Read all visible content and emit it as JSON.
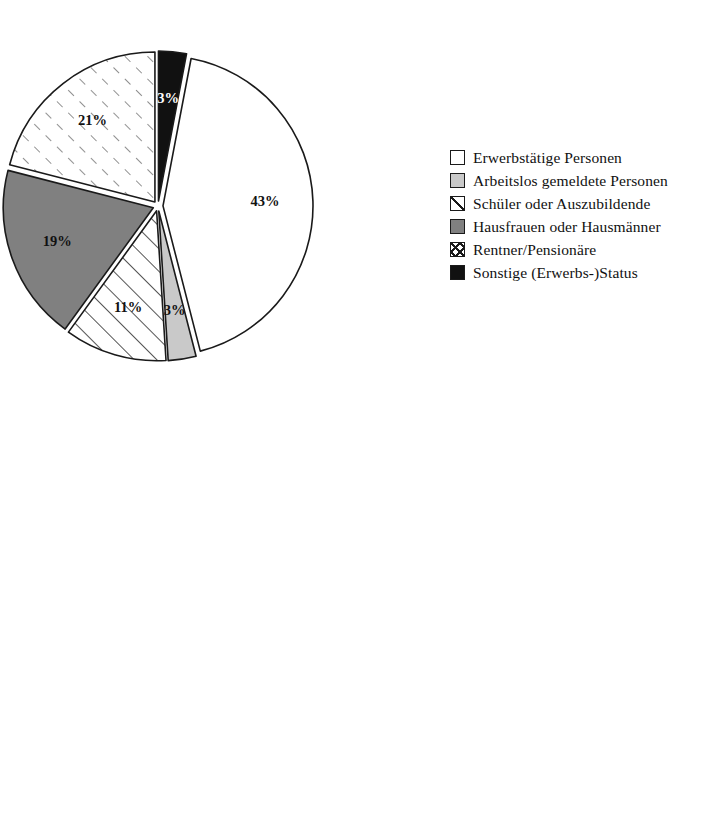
{
  "page": {
    "background": "#ffffff",
    "ink": "#111111"
  },
  "palette": {
    "black": "#111111",
    "white": "#ffffff",
    "light_gray": "#c9c9c9",
    "dark_gray": "#808080",
    "outline": "#1a1a1a"
  },
  "chart_data": [
    {
      "type": "pie",
      "id": "erwerbsstatus",
      "title": "",
      "legend_position": "right",
      "start_angle_deg": 0,
      "categories": [
        "Sonstige (Erwerbs-)Status",
        "Erwerbstätige Personen",
        "Arbeitslos gemeldete Personen",
        "Schüler oder Auszubildende",
        "Hausfrauen oder Hausmänner",
        "Rentner/Pensionäre"
      ],
      "values": [
        3,
        43,
        3,
        11,
        19,
        21
      ],
      "labels": [
        "3%",
        "43%",
        "3%",
        "11%",
        "19%",
        "21%"
      ],
      "fills": [
        "black",
        "white",
        "light_gray",
        "hatch",
        "dark_gray",
        "dash-hatch"
      ],
      "label_colors": [
        "white",
        "dark",
        "dark",
        "dark",
        "dark",
        "dark"
      ],
      "legend": [
        {
          "label": "Erwerbstätige Personen",
          "swatch": "white"
        },
        {
          "label": "Arbeitslos gemeldete Personen",
          "swatch": "light_gray"
        },
        {
          "label": "Schüler oder Auszubildende",
          "swatch": "hatch"
        },
        {
          "label": "Hausfrauen oder Hausmänner",
          "swatch": "dark_gray"
        },
        {
          "label": "Rentner/Pensionäre",
          "swatch": "cross"
        },
        {
          "label": "Sonstige (Erwerbs-)Status",
          "swatch": "black"
        }
      ]
    },
    {
      "type": "pie",
      "id": "altersgruppen",
      "title": "",
      "legend_position": "right",
      "start_angle_deg": 0,
      "categories": [
        "bis unter 20 Jahre",
        "20 bis unter 30 Jahre",
        "30 bis unter 40 Jahre",
        "40 bis unter 50 Jahre",
        "50 bis unter 60 Jahre",
        "60 bis unter 70 Jahre",
        "70 Jahre und älter"
      ],
      "values": [
        8,
        9,
        16,
        19,
        21,
        17,
        10
      ],
      "labels": [
        "8%",
        "9%",
        "16%",
        "19%",
        "21%",
        "17%",
        "10%"
      ],
      "fills": [
        "black",
        "dash-hatch",
        "white",
        "light_gray",
        "hatch",
        "dark_gray",
        "dash-hatch"
      ],
      "label_colors": [
        "white",
        "dark",
        "dark",
        "dark",
        "dark",
        "dark",
        "dark"
      ],
      "legend": [
        {
          "label": "bis unter 20 Jahre",
          "swatch": "black"
        },
        {
          "label": "20 bis unter 30 Jahre",
          "swatch": "cross"
        },
        {
          "label": "30 bis unter 40 Jahre",
          "swatch": "white"
        },
        {
          "label": "40 bis unter 50 Jahre",
          "swatch": "light_gray"
        },
        {
          "label": "50 bis unter 60 Jahre",
          "swatch": "hatch"
        },
        {
          "label": "60 bis unter 70 Jahre",
          "swatch": "dark_gray"
        },
        {
          "label": "70 Jahre und älter",
          "swatch": "cross"
        }
      ]
    }
  ],
  "geometry": [
    {
      "cx": 158,
      "cy": 206,
      "r": 150,
      "explode": 5,
      "label_r": 0.68
    },
    {
      "cx": 222,
      "cy": 612,
      "r": 160,
      "explode": 7,
      "label_r": 0.68
    }
  ]
}
